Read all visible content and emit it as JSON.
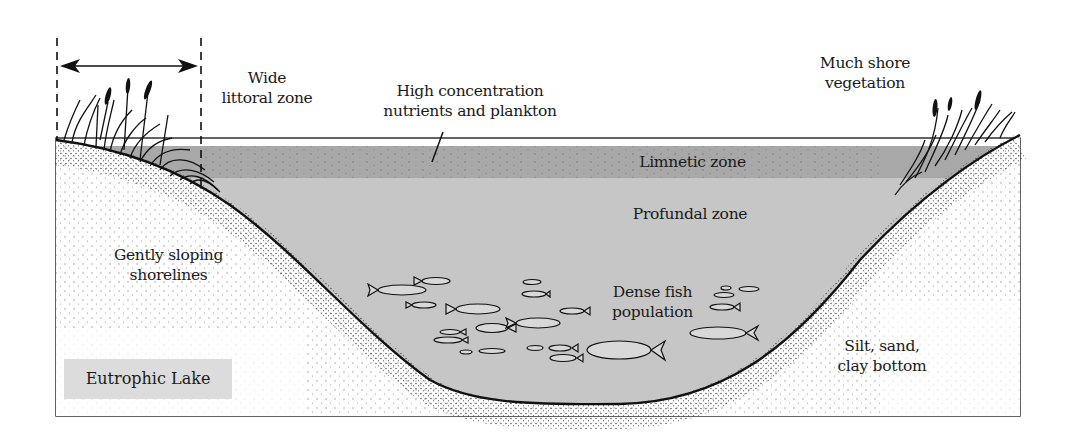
{
  "diagram": {
    "title": "Eutrophic Lake",
    "type": "lake cross-section",
    "labels": {
      "littoral": [
        "Wide",
        "littoral zone"
      ],
      "nutrients": [
        "High concentration",
        "nutrients and plankton"
      ],
      "vegetation": [
        "Much shore",
        "vegetation"
      ],
      "limnetic": "Limnetic zone",
      "profundal": "Profundal  zone",
      "shorelines": [
        "Gently sloping",
        "shorelines"
      ],
      "fish": [
        "Dense fish",
        "population"
      ],
      "bottom": [
        "Silt, sand,",
        "clay bottom"
      ]
    },
    "colors": {
      "limnetic_band": "#a9a9a9",
      "profundal_water": "#c8c8c8",
      "title_box": "#dcdcdc",
      "shore_fill": "#ffffff",
      "outline": "#111111"
    },
    "annotations": {
      "littoral_arrow": "double-headed arrow between dashed lines spanning the littoral zone",
      "nutrient_pointer": "leader line pointing into limnetic band"
    }
  }
}
